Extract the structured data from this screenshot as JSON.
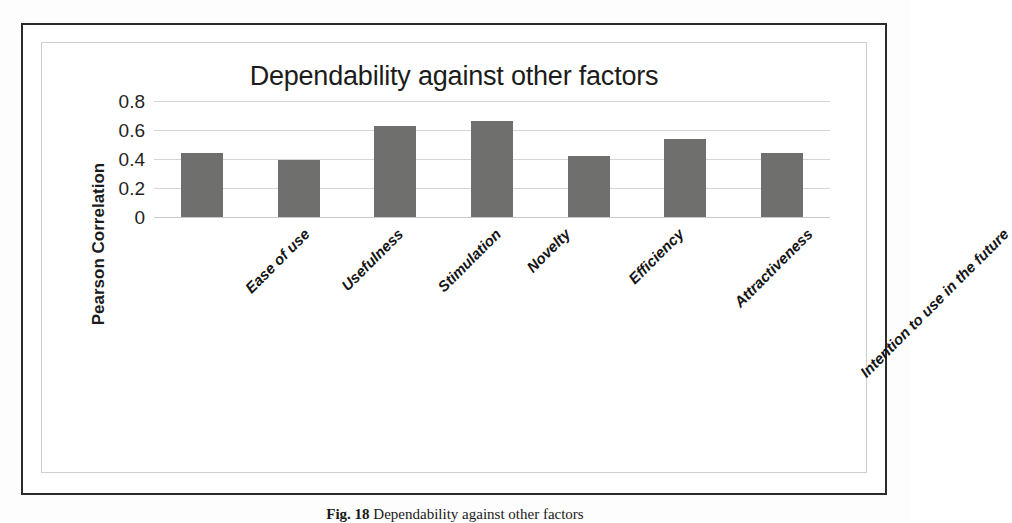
{
  "figure": {
    "caption_label": "Fig. 18",
    "caption_text": "Dependability against other factors"
  },
  "chart_data": {
    "type": "bar",
    "title": "Dependability against other factors",
    "xlabel": "",
    "ylabel": "Pearson Correlation",
    "ylim": [
      0,
      0.8
    ],
    "yticks": [
      "0",
      "0.2",
      "0.4",
      "0.6",
      "0.8"
    ],
    "ytick_values": [
      0,
      0.2,
      0.4,
      0.6,
      0.8
    ],
    "grid": true,
    "legend": "none",
    "bar_color": "#6f6f6d",
    "categories": [
      "Ease of use",
      "Usefulness",
      "Stimulation",
      "Novelty",
      "Efficiency",
      "Attractiveness",
      "Intention to use in the future"
    ],
    "values": [
      0.44,
      0.39,
      0.63,
      0.66,
      0.42,
      0.54,
      0.44
    ]
  }
}
